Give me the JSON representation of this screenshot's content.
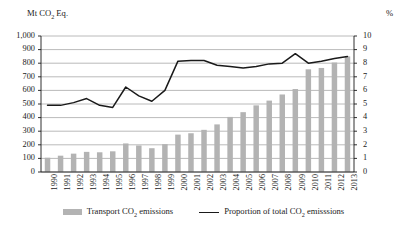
{
  "axes": {
    "left_caption": "Mt CO2 Eq.",
    "left_caption_parts": {
      "pre": "Mt CO",
      "sub": "2",
      "post": " Eq."
    },
    "right_caption": "%"
  },
  "legend": {
    "items": [
      {
        "label": "Transport CO2 emissions",
        "pre": "Transport CO",
        "sub": "2",
        "post": " emissions",
        "marker": "bar-swatch",
        "color": "#b3b3b3"
      },
      {
        "label": "Proportion of total CO2 emisssions",
        "pre": "Proportion of total CO",
        "sub": "2",
        "post": " emisssions",
        "marker": "line-swatch",
        "color": "#1a1a1a"
      }
    ]
  },
  "chart_data": {
    "type": "bar",
    "title": "",
    "xlabel": "",
    "ylabel": "Mt CO2 Eq.",
    "y2label": "%",
    "grid": true,
    "legend_position": "bottom",
    "categories": [
      "1990",
      "1991",
      "1992",
      "1993",
      "1994",
      "1995",
      "1996",
      "1997",
      "1998",
      "1999",
      "2000",
      "2001",
      "2002",
      "2003",
      "2004",
      "2005",
      "2006",
      "2007",
      "2008",
      "2009",
      "2010",
      "2011",
      "2012",
      "2013"
    ],
    "ylim": [
      0,
      1000
    ],
    "yticks": [
      "0",
      "100",
      "200",
      "300",
      "400",
      "500",
      "600",
      "700",
      "800",
      "900",
      "1,000"
    ],
    "y2lim": [
      0,
      10
    ],
    "y2ticks": [
      "0",
      "1",
      "2",
      "3",
      "4",
      "5",
      "6",
      "7",
      "8",
      "9",
      "10"
    ],
    "series": [
      {
        "name": "Transport CO2 emissions",
        "type": "bar",
        "axis": "left",
        "color": "#b3b3b3",
        "values": [
          105,
          120,
          135,
          148,
          145,
          152,
          210,
          195,
          175,
          205,
          275,
          285,
          310,
          350,
          405,
          440,
          490,
          525,
          570,
          610,
          755,
          765,
          805,
          850
        ]
      },
      {
        "name": "Proportion of total CO2 emisssions",
        "type": "line",
        "axis": "right",
        "color": "#1a1a1a",
        "values": [
          4.9,
          4.9,
          5.1,
          5.4,
          4.9,
          4.75,
          6.25,
          5.6,
          5.2,
          6.0,
          8.15,
          8.2,
          8.2,
          7.85,
          7.75,
          7.65,
          7.75,
          7.95,
          8.0,
          8.7,
          8.0,
          8.15,
          8.35,
          8.5
        ]
      }
    ]
  }
}
